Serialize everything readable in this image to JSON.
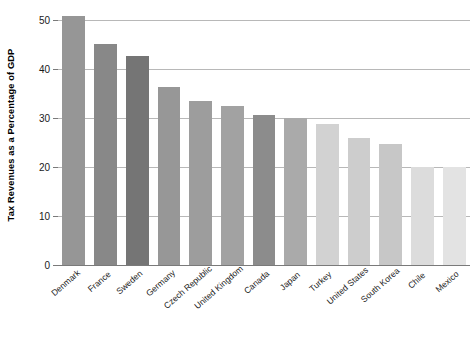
{
  "chart_data": {
    "type": "bar",
    "title": "",
    "xlabel": "",
    "ylabel": "Tax Revenues as a Percentage of GDP",
    "ylim": [
      0,
      52
    ],
    "yticks": [
      0,
      10,
      20,
      30,
      40,
      50
    ],
    "ytick_labels": [
      "0",
      "10",
      "20",
      "30",
      "40",
      "50"
    ],
    "grid": true,
    "legend": "none",
    "categories": [
      "Denmark",
      "France",
      "Sweden",
      "Germany",
      "Czech Republic",
      "United Kingdom",
      "Canada",
      "Japan",
      "Turkey",
      "United States",
      "South Korea",
      "Chile",
      "Mexico"
    ],
    "values": [
      50.7,
      45.1,
      42.6,
      36.2,
      33.5,
      32.4,
      30.5,
      30.0,
      28.7,
      26.0,
      24.7,
      19.9,
      19.9
    ],
    "bar_colors": [
      "#969696",
      "#888888",
      "#757575",
      "#979797",
      "#9d9d9d",
      "#a2a2a2",
      "#8c8c8c",
      "#aaaaaa",
      "#d2d2d2",
      "#cdcdcd",
      "#c7c7c7",
      "#dcdcdc",
      "#e3e3e3"
    ]
  },
  "axis": {
    "grid_color": "#b8b8b8",
    "axis_color": "#7a7a7a",
    "text_color": "#1a1a1a"
  }
}
